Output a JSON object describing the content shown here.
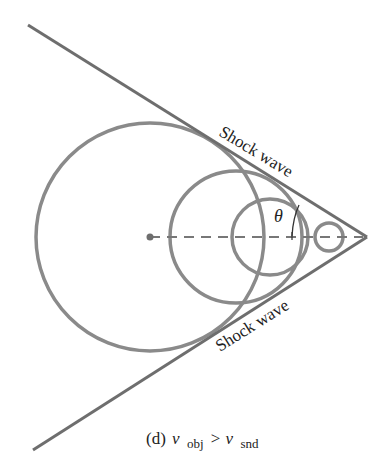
{
  "figure": {
    "caption": {
      "prefix": "(d)",
      "v1": "v",
      "sub1": "obj",
      "op": ">",
      "v2": "v",
      "sub2": "snd"
    },
    "labels": {
      "shock_wave_upper": "Shock wave",
      "shock_wave_lower": "Shock wave",
      "angle": "θ"
    },
    "colors": {
      "wavefront": "#8a8a8a",
      "shock_line": "#6e6e6e",
      "axis_dash": "#777777",
      "text": "#222222",
      "background": "#ffffff"
    },
    "geometry": {
      "apex": [
        367,
        237
      ],
      "shock_upper_start": [
        28,
        25
      ],
      "shock_lower_start": [
        33,
        450
      ],
      "source_point": [
        150,
        237
      ],
      "wavefronts": [
        {
          "cx": 150,
          "cy": 237,
          "r": 114
        },
        {
          "cx": 236,
          "cy": 237,
          "r": 66
        },
        {
          "cx": 270,
          "cy": 237,
          "r": 38
        },
        {
          "cx": 329,
          "cy": 237,
          "r": 14
        }
      ]
    }
  }
}
